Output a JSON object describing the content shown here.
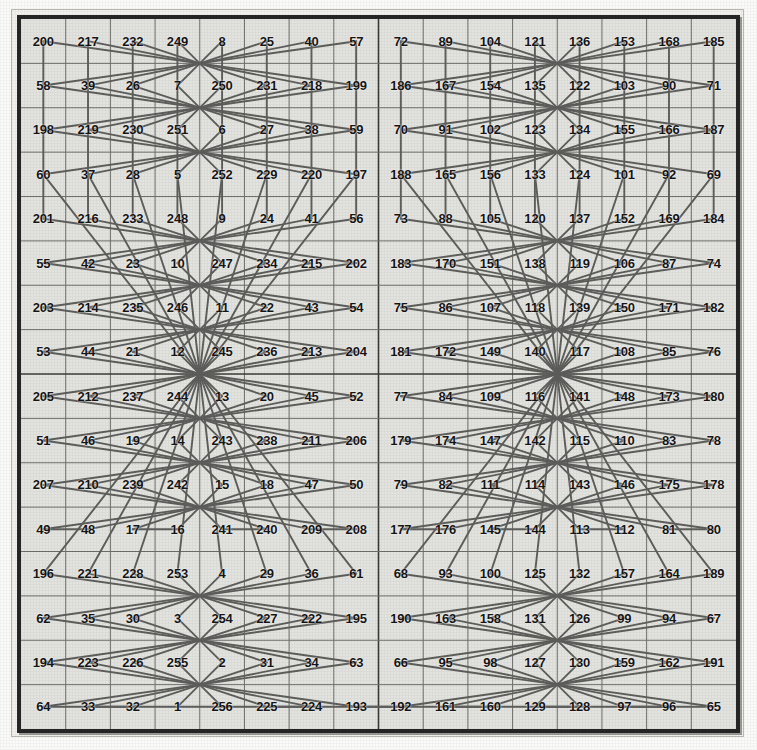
{
  "figure": {
    "kind": "magic-square-knights-tour",
    "rows": 16,
    "cols": 16,
    "min_value": 1,
    "max_value": 256,
    "background_color": "#e3e3df",
    "frame_color": "#262626",
    "grid_line_color": "#6f6f6c",
    "tour_line_color": "#5e5e5c",
    "text_color": "#141414"
  },
  "chart_data": {
    "type": "table",
    "title": "",
    "xlabel": "",
    "ylabel": "",
    "grid": true,
    "legend": "none",
    "rows": 16,
    "cols": 16,
    "values": [
      [
        200,
        217,
        232,
        249,
        8,
        25,
        40,
        57,
        72,
        89,
        104,
        121,
        136,
        153,
        168,
        185
      ],
      [
        58,
        39,
        26,
        7,
        250,
        231,
        218,
        199,
        186,
        167,
        154,
        135,
        122,
        103,
        90,
        71
      ],
      [
        198,
        219,
        230,
        251,
        6,
        27,
        38,
        59,
        70,
        91,
        102,
        123,
        134,
        155,
        166,
        187
      ],
      [
        60,
        37,
        28,
        5,
        252,
        229,
        220,
        197,
        188,
        165,
        156,
        133,
        124,
        101,
        92,
        69
      ],
      [
        201,
        216,
        233,
        248,
        9,
        24,
        41,
        56,
        73,
        88,
        105,
        120,
        137,
        152,
        169,
        184
      ],
      [
        55,
        42,
        23,
        10,
        247,
        234,
        215,
        202,
        183,
        170,
        151,
        138,
        119,
        106,
        87,
        74
      ],
      [
        203,
        214,
        235,
        246,
        11,
        22,
        43,
        54,
        75,
        86,
        107,
        118,
        139,
        150,
        171,
        182
      ],
      [
        53,
        44,
        21,
        12,
        245,
        236,
        213,
        204,
        181,
        172,
        149,
        140,
        117,
        108,
        85,
        76
      ],
      [
        205,
        212,
        237,
        244,
        13,
        20,
        45,
        52,
        77,
        84,
        109,
        116,
        141,
        148,
        173,
        180
      ],
      [
        51,
        46,
        19,
        14,
        243,
        238,
        211,
        206,
        179,
        174,
        147,
        142,
        115,
        110,
        83,
        78
      ],
      [
        207,
        210,
        239,
        242,
        15,
        18,
        47,
        50,
        79,
        82,
        111,
        114,
        143,
        146,
        175,
        178
      ],
      [
        49,
        48,
        17,
        16,
        241,
        240,
        209,
        208,
        177,
        176,
        145,
        144,
        113,
        112,
        81,
        80
      ],
      [
        196,
        221,
        228,
        253,
        4,
        29,
        36,
        61,
        68,
        93,
        100,
        125,
        132,
        157,
        164,
        189
      ],
      [
        62,
        35,
        30,
        3,
        254,
        227,
        222,
        195,
        190,
        163,
        158,
        131,
        126,
        99,
        94,
        67
      ],
      [
        194,
        223,
        226,
        255,
        2,
        31,
        34,
        63,
        66,
        95,
        98,
        127,
        130,
        159,
        162,
        191
      ],
      [
        64,
        33,
        32,
        1,
        256,
        225,
        224,
        193,
        192,
        161,
        160,
        129,
        128,
        97,
        96,
        65
      ]
    ]
  }
}
